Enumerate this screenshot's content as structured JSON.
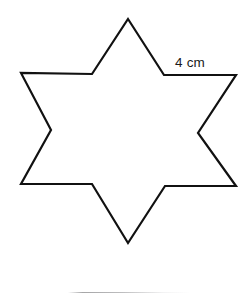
{
  "figure": {
    "name": "six-pointed-star",
    "stroke_color": "#111111",
    "fill_color": "#ffffff",
    "stroke_width": 2.2,
    "background_color": "#ffffff",
    "canvas": {
      "width": 251,
      "height": 298
    },
    "outline_points": "128,19 164,75 236,75 198,133 236,186 165,186 128,243 92,184 21,184 51,130 21,73 92,74",
    "outer_vertices": [
      {
        "label": "top",
        "x": 128,
        "y": 19
      },
      {
        "label": "upper-right",
        "x": 236,
        "y": 75
      },
      {
        "label": "lower-right",
        "x": 236,
        "y": 186
      },
      {
        "label": "bottom",
        "x": 128,
        "y": 243
      },
      {
        "label": "lower-left",
        "x": 21,
        "y": 184
      },
      {
        "label": "upper-left",
        "x": 21,
        "y": 73
      }
    ],
    "inner_vertices": [
      {
        "label": "upper-right-inner",
        "x": 164,
        "y": 75
      },
      {
        "label": "right-inner",
        "x": 198,
        "y": 133
      },
      {
        "label": "lower-right-inner",
        "x": 165,
        "y": 186
      },
      {
        "label": "lower-left-inner",
        "x": 92,
        "y": 184
      },
      {
        "label": "left-inner",
        "x": 51,
        "y": 130
      },
      {
        "label": "upper-left-inner",
        "x": 92,
        "y": 74
      }
    ]
  },
  "annotations": {
    "side_length": {
      "text": "4 cm",
      "value": 4,
      "unit": "cm",
      "color": "#1a1a1a",
      "refers_to_edge": "upper-right-inner-to-upper-right-outer"
    }
  },
  "footer": {
    "rule_color": "#a8a8aa"
  }
}
